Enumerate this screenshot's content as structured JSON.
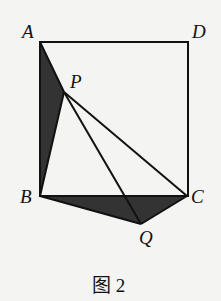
{
  "figure": {
    "caption": "图 2",
    "points": {
      "A": {
        "label": "A",
        "x": 40,
        "y": 42
      },
      "D": {
        "label": "D",
        "x": 190,
        "y": 42
      },
      "B": {
        "label": "B",
        "x": 40,
        "y": 196
      },
      "C": {
        "label": "C",
        "x": 187,
        "y": 196
      },
      "P": {
        "label": "P",
        "x": 64,
        "y": 92
      },
      "Q": {
        "label": "Q",
        "x": 141,
        "y": 224
      }
    },
    "shaded_regions": [
      "triangle ABP",
      "triangle BQC"
    ],
    "segments": [
      "AD",
      "DC",
      "AB",
      "BC",
      "AP",
      "PB",
      "PC",
      "PQ",
      "BQ",
      "QC"
    ],
    "colors": {
      "line": "#111111",
      "fill": "#333333",
      "background": "#f4f4f2"
    }
  }
}
